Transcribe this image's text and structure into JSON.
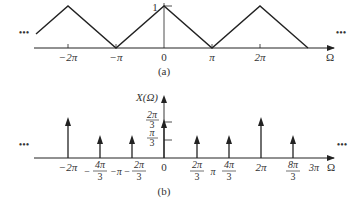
{
  "panel_a": {
    "caption": "(a)",
    "peak_label": "1",
    "axis_label": "Ω",
    "ellipsis": "•••",
    "ticks": [
      {
        "label": "−2π",
        "x": 68
      },
      {
        "label": "−π",
        "x": 116
      },
      {
        "label": "0",
        "x": 164
      },
      {
        "label": "π",
        "x": 212
      },
      {
        "label": "2π",
        "x": 260
      }
    ],
    "description": "Periodic triangular waveform with period 2π, peak 1 at multiples of 2π, zero at odd multiples of π"
  },
  "panel_b": {
    "caption": "(b)",
    "y_label": "X(Ω)",
    "axis_label": "Ω",
    "ellipsis": "•••",
    "y_ticks": [
      {
        "num": "2π",
        "den": "3"
      },
      {
        "num": "π",
        "den": "3"
      }
    ],
    "x_ticks": [
      {
        "label": "−2π"
      },
      {
        "label": "−4π/3",
        "num": "4π",
        "den": "3",
        "sign": "−"
      },
      {
        "label": "−π"
      },
      {
        "label": "−2π/3",
        "num": "2π",
        "den": "3",
        "sign": "−"
      },
      {
        "label": "0"
      },
      {
        "label": "2π/3",
        "num": "2π",
        "den": "3"
      },
      {
        "label": "π"
      },
      {
        "label": "4π/3",
        "num": "4π",
        "den": "3"
      },
      {
        "label": "2π"
      },
      {
        "label": "8π/3",
        "num": "8π",
        "den": "3"
      },
      {
        "label": "3π"
      }
    ],
    "impulses": [
      {
        "position": "−2π",
        "weight": "2π/3"
      },
      {
        "position": "−4π/3",
        "weight": "π/3"
      },
      {
        "position": "−2π/3",
        "weight": "π/3"
      },
      {
        "position": "0",
        "weight": "2π/3"
      },
      {
        "position": "2π/3",
        "weight": "π/3"
      },
      {
        "position": "4π/3",
        "weight": "π/3"
      },
      {
        "position": "2π",
        "weight": "2π/3"
      },
      {
        "position": "8π/3",
        "weight": "π/3"
      }
    ]
  }
}
